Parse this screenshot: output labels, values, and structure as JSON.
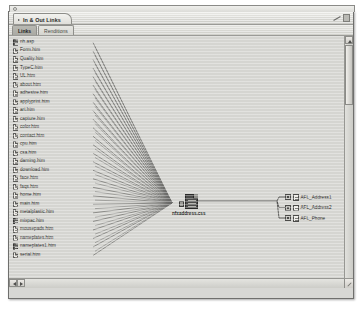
{
  "window": {
    "title": "In & Out Links",
    "title_tri_icon": "triangle-right-icon",
    "toolbar_icon": "pencil-icon"
  },
  "tabs": [
    {
      "label": "Links",
      "active": true
    },
    {
      "label": "Renditions",
      "active": false
    }
  ],
  "filelist": [
    {
      "name": "nh.asp",
      "icon": "document-icon",
      "variant": "dark"
    },
    {
      "name": "Form.htm",
      "icon": "document-icon",
      "variant": "light"
    },
    {
      "name": "Quality.htm",
      "icon": "document-icon",
      "variant": "light"
    },
    {
      "name": "TypeC.htm",
      "icon": "document-icon",
      "variant": "light"
    },
    {
      "name": "UL.htm",
      "icon": "document-icon",
      "variant": "light"
    },
    {
      "name": "about.htm",
      "icon": "document-icon",
      "variant": "light"
    },
    {
      "name": "adhesive.htm",
      "icon": "document-icon",
      "variant": "light"
    },
    {
      "name": "applyprint.htm",
      "icon": "document-icon",
      "variant": "light"
    },
    {
      "name": "art.htm",
      "icon": "document-icon",
      "variant": "light"
    },
    {
      "name": "capture.htm",
      "icon": "document-icon",
      "variant": "light"
    },
    {
      "name": "color.htm",
      "icon": "document-icon",
      "variant": "light"
    },
    {
      "name": "contact.htm",
      "icon": "document-icon",
      "variant": "light"
    },
    {
      "name": "cpu.htm",
      "icon": "document-icon",
      "variant": "light"
    },
    {
      "name": "csa.htm",
      "icon": "document-icon",
      "variant": "light"
    },
    {
      "name": "darning.htm",
      "icon": "document-icon",
      "variant": "light"
    },
    {
      "name": "download.htm",
      "icon": "document-icon",
      "variant": "light"
    },
    {
      "name": "face.htm",
      "icon": "document-icon",
      "variant": "light"
    },
    {
      "name": "faqs.htm",
      "icon": "document-icon",
      "variant": "light"
    },
    {
      "name": "home.htm",
      "icon": "document-icon",
      "variant": "light"
    },
    {
      "name": "main.htm",
      "icon": "document-icon",
      "variant": "light"
    },
    {
      "name": "metalplastic.htm",
      "icon": "document-icon",
      "variant": "light"
    },
    {
      "name": "mixpac.htm",
      "icon": "document-icon",
      "variant": "dark"
    },
    {
      "name": "mousepads.htm",
      "icon": "document-icon",
      "variant": "light"
    },
    {
      "name": "nameplates.htm",
      "icon": "document-icon",
      "variant": "light"
    },
    {
      "name": "nameplates1.htm",
      "icon": "document-icon",
      "variant": "dark"
    },
    {
      "name": "serial.htm",
      "icon": "document-icon",
      "variant": "light"
    }
  ],
  "center_node": {
    "label": "nfxaddress.css",
    "icon": "stylesheet-file-icon"
  },
  "right_nodes": [
    {
      "label": "AFL_Address1",
      "icon": "link-target-icon"
    },
    {
      "label": "AFL_Address2",
      "icon": "link-target-icon"
    },
    {
      "label": "AFL_Phone",
      "icon": "link-target-icon"
    }
  ],
  "colors": {
    "canvas": "#d5d5d1",
    "chrome": "#d7d7d4",
    "line": "#6b6b68",
    "text": "#1f1f1e"
  }
}
